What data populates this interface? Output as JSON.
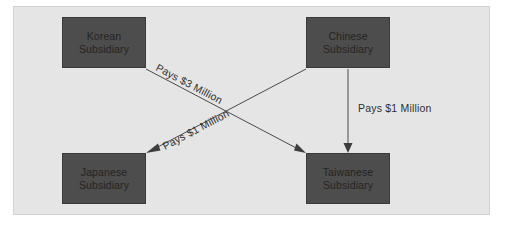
{
  "diagram": {
    "background_color": "#e5e5e5",
    "node_fill_color": "#4d4d4d",
    "node_text_color": "#242424",
    "edge_color": "#4a4a4a",
    "nodes": [
      {
        "id": "korean",
        "line1": "Korean",
        "line2": "Subsidiary"
      },
      {
        "id": "chinese",
        "line1": "Chinese",
        "line2": "Subsidiary"
      },
      {
        "id": "japanese",
        "line1": "Japanese",
        "line2": "Subsidiary"
      },
      {
        "id": "taiwanese",
        "line1": "Taiwanese",
        "line2": "Subsidiary"
      }
    ],
    "edges": [
      {
        "id": "korean-to-taiwanese",
        "from": "Korean Subsidiary",
        "to": "Taiwanese Subsidiary",
        "label": "Pays $3 Million",
        "amount": 3,
        "currency": "USD",
        "unit": "Million"
      },
      {
        "id": "chinese-to-japanese",
        "from": "Chinese Subsidiary",
        "to": "Japanese Subsidiary",
        "label": "Pays $1 Million",
        "amount": 1,
        "currency": "USD",
        "unit": "Million"
      },
      {
        "id": "chinese-to-taiwanese",
        "from": "Chinese Subsidiary",
        "to": "Taiwanese Subsidiary",
        "label": "Pays $1 Million",
        "amount": 1,
        "currency": "USD",
        "unit": "Million"
      }
    ]
  }
}
